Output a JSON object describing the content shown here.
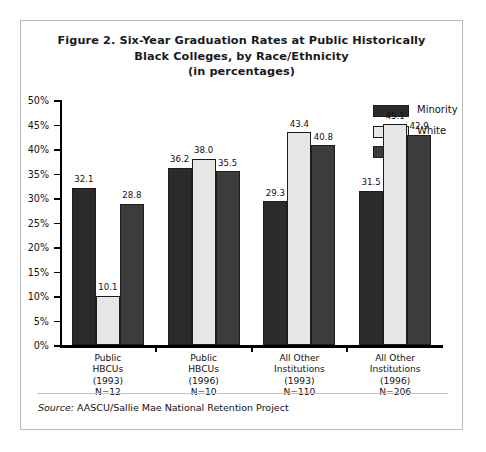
{
  "figure": {
    "title_line1": "Figure 2. Six-Year Graduation Rates at Public Historically",
    "title_line2": "Black Colleges, by Race/Ethnicity",
    "title_line3": "(in percentages)",
    "source_prefix": "Source:",
    "source_text": "AASCU/Sallie Mae National Retention Project"
  },
  "legend": {
    "position": "top-right",
    "items": [
      {
        "label": "Minority",
        "color": "#2b2b2b",
        "swatch": "minority"
      },
      {
        "label": "White",
        "color": "#e6e6e6",
        "swatch": "white"
      },
      {
        "label": "All",
        "color": "#3c3c3c",
        "swatch": "all"
      }
    ]
  },
  "axis": {
    "y_ticks": [
      "0%",
      "5%",
      "10%",
      "15%",
      "20%",
      "25%",
      "30%",
      "35%",
      "40%",
      "45%",
      "50%"
    ]
  },
  "categories_multiline": [
    [
      "Public",
      "HBCUs",
      "(1993)",
      "N=12"
    ],
    [
      "Public",
      "HBCUs",
      "(1996)",
      "N=10"
    ],
    [
      "All Other",
      "Institutions",
      "(1993)",
      "N=110"
    ],
    [
      "All Other",
      "Institutions",
      "(1996)",
      "N=206"
    ]
  ],
  "chart_data": {
    "type": "bar",
    "title": "Figure 2. Six-Year Graduation Rates at Public Historically Black Colleges, by Race/Ethnicity (in percentages)",
    "xlabel": "",
    "ylabel": "",
    "ylim": [
      0,
      50
    ],
    "ytick_step": 5,
    "ytick_format": "percent",
    "grid": false,
    "legend_position": "top-right",
    "categories": [
      "Public HBCUs (1993) N=12",
      "Public HBCUs (1996) N=10",
      "All Other Institutions (1993) N=110",
      "All Other Institutions (1996) N=206"
    ],
    "series": [
      {
        "name": "Minority",
        "color": "#2b2b2b",
        "values": [
          32.1,
          36.2,
          29.3,
          31.5
        ]
      },
      {
        "name": "White",
        "color": "#e6e6e6",
        "values": [
          10.1,
          38.0,
          43.4,
          45.1
        ]
      },
      {
        "name": "All",
        "color": "#3c3c3c",
        "values": [
          28.8,
          35.5,
          40.8,
          42.9
        ]
      }
    ],
    "data_labels": [
      [
        "32.1",
        "10.1",
        "28.8"
      ],
      [
        "36.2",
        "38.0",
        "35.5"
      ],
      [
        "29.3",
        "43.4",
        "40.8"
      ],
      [
        "31.5",
        "45.1",
        "42.9"
      ]
    ],
    "source": "Source: AASCU/Sallie Mae National Retention Project"
  }
}
